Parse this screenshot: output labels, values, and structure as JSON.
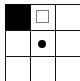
{
  "board": {
    "type": "grid-puzzle",
    "visible_rows": 3,
    "visible_cols": 3,
    "line_color": "#111111",
    "cells": [
      {
        "row": 0,
        "col": 0,
        "state": "filled",
        "color": "#000000"
      },
      {
        "row": 0,
        "col": 1,
        "state": "hollow-square",
        "color": "#777777"
      },
      {
        "row": 0,
        "col": 2,
        "state": "empty"
      },
      {
        "row": 1,
        "col": 0,
        "state": "empty"
      },
      {
        "row": 1,
        "col": 1,
        "state": "dot",
        "color": "#000000"
      },
      {
        "row": 1,
        "col": 2,
        "state": "empty"
      },
      {
        "row": 2,
        "col": 0,
        "state": "empty"
      },
      {
        "row": 2,
        "col": 1,
        "state": "empty"
      },
      {
        "row": 2,
        "col": 2,
        "state": "empty"
      }
    ]
  }
}
